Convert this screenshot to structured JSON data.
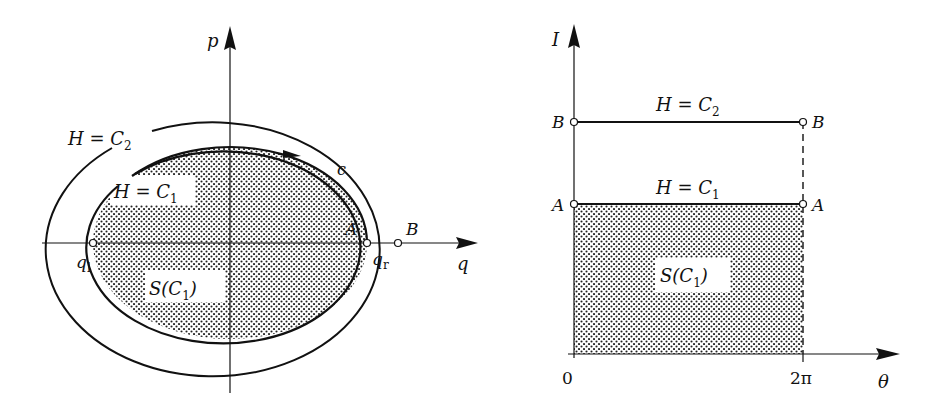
{
  "colors": {
    "ink": "#111111",
    "background": "#ffffff",
    "dot": "#222222"
  },
  "left_panel": {
    "axes": {
      "horizontal_label": "q",
      "vertical_label": "p"
    },
    "curves": [
      {
        "id": "outer",
        "label_main": "H = C",
        "label_sub": "2"
      },
      {
        "id": "inner",
        "label_main": "H = C",
        "label_sub": "1",
        "orbit_label": "c"
      }
    ],
    "region_label_main": "S(C",
    "region_label_sub": "1",
    "region_label_close": ")",
    "points": [
      {
        "id": "q_left",
        "label_main": "q",
        "label_sub": "l"
      },
      {
        "id": "A",
        "label_main": "A",
        "under_main": "q",
        "under_sub": "r"
      },
      {
        "id": "B",
        "label_main": "B"
      }
    ]
  },
  "right_panel": {
    "axes": {
      "horizontal_label": "θ",
      "vertical_label": "I",
      "x_ticks": [
        "0",
        "2π"
      ]
    },
    "lines": [
      {
        "id": "C2",
        "label_main": "H = C",
        "label_sub": "2",
        "endpoint_label": "B"
      },
      {
        "id": "C1",
        "label_main": "H = C",
        "label_sub": "1",
        "endpoint_label": "A"
      }
    ],
    "region_label_main": "S(C",
    "region_label_sub": "1",
    "region_label_close": ")"
  }
}
